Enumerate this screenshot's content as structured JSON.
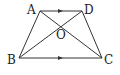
{
  "diagram": {
    "type": "trapezoid",
    "points": {
      "A": {
        "label": "A",
        "x": 40,
        "y": 11
      },
      "D": {
        "label": "D",
        "x": 82,
        "y": 11
      },
      "B": {
        "label": "B",
        "x": 19,
        "y": 58
      },
      "C": {
        "label": "C",
        "x": 102,
        "y": 58
      },
      "O": {
        "label": "O",
        "x": 61,
        "y": 27
      }
    },
    "segments": [
      "AD",
      "BC",
      "AB",
      "DC",
      "AC",
      "BD"
    ],
    "parallel_marks": [
      "AD",
      "BC"
    ],
    "line_color": "#333333"
  }
}
